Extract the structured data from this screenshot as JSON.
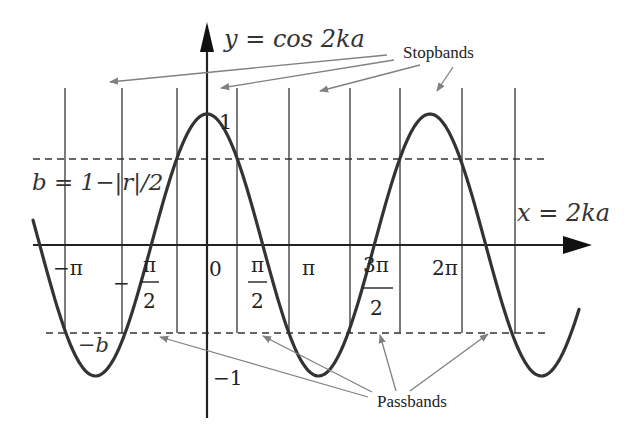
{
  "diagram": {
    "y_axis_label": "y = cos 2ka",
    "x_axis_label": "x = 2ka",
    "b_label": "b = 1−|r|/2",
    "neg_b_label": "−b",
    "y_tick_top": "1",
    "y_tick_bottom": "−1",
    "x_ticks": [
      {
        "id": "neg-pi",
        "num": "−π",
        "den": ""
      },
      {
        "id": "neg-half-pi",
        "prefix": "−",
        "num": "π",
        "den": "2"
      },
      {
        "id": "zero",
        "num": "0",
        "den": ""
      },
      {
        "id": "half-pi",
        "num": "π",
        "den": "2"
      },
      {
        "id": "pi",
        "num": "π",
        "den": ""
      },
      {
        "id": "three-half-pi",
        "num": "3π",
        "den": "2"
      },
      {
        "id": "two-pi",
        "num": "2π",
        "den": ""
      }
    ],
    "annotations": {
      "stopbands": "Stopbands",
      "passbands": "Passbands"
    },
    "colors": {
      "curve": "#333333",
      "axes": "#222222",
      "grid_lines": "#333333",
      "dashed": "#333333",
      "arrows": "#808080"
    },
    "function": "y = cos x",
    "x_range": [
      "-1.25π",
      "2.75π"
    ],
    "threshold_b": 0.66
  }
}
